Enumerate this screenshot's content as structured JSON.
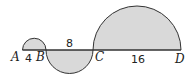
{
  "figure": {
    "type": "semicircles on a line",
    "fill_color": "#d9d9d9",
    "stroke_color": "#333333",
    "points": [
      {
        "name": "A",
        "label": "A"
      },
      {
        "name": "B",
        "label": "B"
      },
      {
        "name": "C",
        "label": "C"
      },
      {
        "name": "D",
        "label": "D"
      }
    ],
    "segments": [
      {
        "from": "A",
        "to": "B",
        "length_label": "4",
        "semicircle": "above"
      },
      {
        "from": "B",
        "to": "C",
        "length_label": "8",
        "semicircle": "below"
      },
      {
        "from": "C",
        "to": "D",
        "length_label": "16",
        "semicircle": "above"
      }
    ]
  }
}
